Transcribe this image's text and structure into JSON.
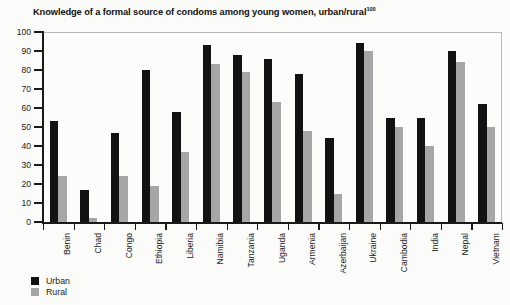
{
  "title": {
    "text": "Knowledge of a formal source of condoms among young women, urban/rural",
    "superscript": "100"
  },
  "legend": {
    "position": "bottom-left",
    "items": [
      {
        "label": "Urban",
        "color": "#121212"
      },
      {
        "label": "Rural",
        "color": "#a6a6a6"
      }
    ]
  },
  "axis": {
    "y_ticks": [
      "0",
      "10",
      "20",
      "30",
      "40",
      "50",
      "60",
      "70",
      "80",
      "90",
      "100"
    ]
  },
  "chart_data": {
    "type": "bar",
    "title": "Knowledge of a formal source of condoms among young women, urban/rural",
    "xlabel": "",
    "ylabel": "",
    "ylim": [
      0,
      100
    ],
    "ytick_step": 10,
    "grid": false,
    "legend_position": "bottom-left",
    "categories": [
      "Benin",
      "Chad",
      "Congo",
      "Ethiopia",
      "Liberia",
      "Namibia",
      "Tanzania",
      "Uganda",
      "Armenia",
      "Azerbaijan",
      "Ukraine",
      "Cambodia",
      "India",
      "Nepal",
      "Vietnam"
    ],
    "series": [
      {
        "name": "Urban",
        "color": "#121212",
        "values": [
          53,
          17,
          47,
          80,
          58,
          93,
          88,
          86,
          78,
          44,
          94,
          55,
          55,
          90,
          62
        ]
      },
      {
        "name": "Rural",
        "color": "#a6a6a6",
        "values": [
          24,
          2,
          24,
          19,
          37,
          83,
          79,
          63,
          48,
          15,
          90,
          50,
          40,
          84,
          50
        ]
      }
    ]
  }
}
